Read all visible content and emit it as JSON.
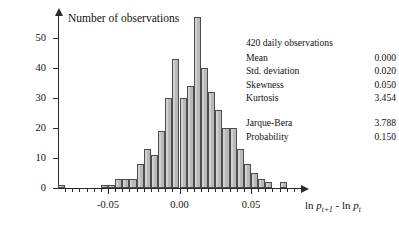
{
  "chart_data": {
    "type": "bar",
    "title": "",
    "ylabel": "Number of observations",
    "xlabel": "ln p_{t+1} - ln p_t",
    "xlabel_parts": {
      "ln1": "ln",
      "p1": "p",
      "sub1": "t+1",
      "minus": "-",
      "ln2": "ln",
      "p2": "p",
      "sub2": "t"
    },
    "ylim": [
      0,
      58
    ],
    "xlim": [
      -0.085,
      0.085
    ],
    "grid": false,
    "legend": "none",
    "bar_fill": "#b9b9b9",
    "bar_edge": "#4d4d4d",
    "ytick_labels": [
      "0",
      "10",
      "20",
      "30",
      "40",
      "50"
    ],
    "ytick_values": [
      0,
      10,
      20,
      30,
      40,
      50
    ],
    "xtick_labels": [
      "-0.05",
      "0.00",
      "0.05"
    ],
    "xtick_values": [
      -0.05,
      0.0,
      0.05
    ],
    "bin_width": 0.005,
    "categories": [
      -0.0825,
      -0.0775,
      -0.0725,
      -0.0675,
      -0.0625,
      -0.0575,
      -0.0525,
      -0.0475,
      -0.0425,
      -0.0375,
      -0.0325,
      -0.0275,
      -0.0225,
      -0.0175,
      -0.0125,
      -0.0075,
      -0.0025,
      0.0025,
      0.0075,
      0.0125,
      0.0175,
      0.0225,
      0.0275,
      0.0325,
      0.0375,
      0.0425,
      0.0475,
      0.0525,
      0.0575,
      0.0625,
      0.0675,
      0.0725
    ],
    "values": [
      1,
      0,
      0,
      0,
      0,
      0,
      1,
      1,
      3,
      3,
      3,
      8,
      13,
      11,
      19,
      30,
      43,
      30,
      34,
      57,
      40,
      32,
      26,
      20,
      20,
      13,
      8,
      5,
      3,
      2,
      0,
      2
    ],
    "annotations": {
      "observations": "420 daily observations",
      "stats": [
        {
          "label": "Mean",
          "value": "0.000"
        },
        {
          "label": "Std. deviation",
          "value": "0.020"
        },
        {
          "label": "Skewness",
          "value": "0.050"
        },
        {
          "label": "Kurtosis",
          "value": "3.454"
        }
      ],
      "tests": [
        {
          "label": "Jarque-Bera",
          "value": "3.788"
        },
        {
          "label": "Probability",
          "value": "0.150"
        }
      ]
    }
  },
  "stats_panel": {
    "observations": "420 daily observations",
    "mean_label": "Mean",
    "mean_value": "0.000",
    "std_label": "Std. deviation",
    "std_value": "0.020",
    "skew_label": "Skewness",
    "skew_value": "0.050",
    "kurt_label": "Kurtosis",
    "kurt_value": "3.454",
    "jb_label": "Jarque-Bera",
    "jb_value": "3.788",
    "prob_label": "Probability",
    "prob_value": "0.150"
  },
  "axis": {
    "y_title": "Number of observations"
  }
}
